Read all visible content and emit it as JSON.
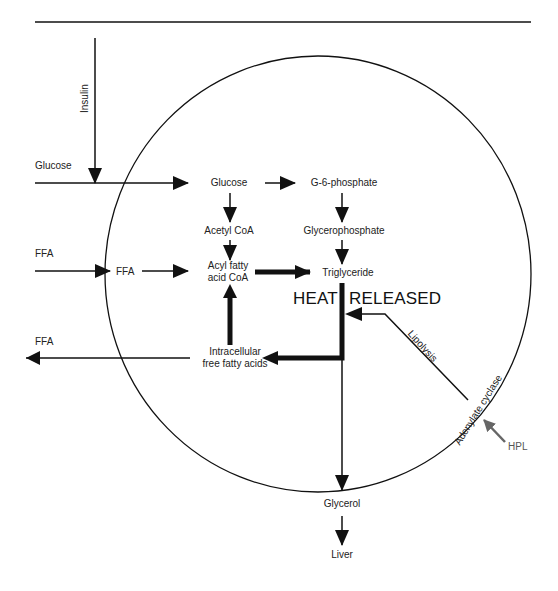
{
  "diagram": {
    "type": "metabolic-pathway",
    "cell_boundary": "circle",
    "labels": {
      "insulin": "Insulin",
      "glucose_outside": "Glucose",
      "ffa_in_outside": "FFA",
      "ffa_out_outside": "FFA",
      "ffa_inside": "FFA",
      "glucose_inside": "Glucose",
      "g6p": "G-6-phosphate",
      "acetyl_coa": "Acetyl CoA",
      "glycerophosphate": "Glycerophosphate",
      "acyl_line1": "Acyl fatty",
      "acyl_line2": "acid CoA",
      "triglyceride": "Triglyceride",
      "heat_left": "HEAT",
      "heat_right": "RELEASED",
      "intracellular_line1": "Intracellular",
      "intracellular_line2": "free fatty acids",
      "lipolysis": "Lipolysis",
      "adenylate_cyclase": "Adenylate cyclase",
      "hpl": "HPL",
      "glycerol": "Glycerol",
      "liver": "Liver"
    },
    "edges": [
      {
        "from": "Insulin",
        "to": "Glucose uptake"
      },
      {
        "from": "Glucose (outside)",
        "to": "Glucose"
      },
      {
        "from": "Glucose",
        "to": "G-6-phosphate"
      },
      {
        "from": "Glucose",
        "to": "Acetyl CoA"
      },
      {
        "from": "G-6-phosphate",
        "to": "Glycerophosphate"
      },
      {
        "from": "Acetyl CoA",
        "to": "Acyl fatty acid CoA"
      },
      {
        "from": "Glycerophosphate",
        "to": "Triglyceride"
      },
      {
        "from": "FFA (outside)",
        "to": "FFA"
      },
      {
        "from": "FFA",
        "to": "Acyl fatty acid CoA"
      },
      {
        "from": "Acyl fatty acid CoA",
        "to": "Triglyceride",
        "weight": "bold"
      },
      {
        "from": "Triglyceride",
        "to": "Intracellular free fatty acids",
        "weight": "bold"
      },
      {
        "from": "Intracellular free fatty acids",
        "to": "Acyl fatty acid CoA",
        "weight": "bold"
      },
      {
        "from": "Intracellular free fatty acids",
        "to": "FFA (outside)"
      },
      {
        "from": "Triglyceride",
        "to": "Glycerol"
      },
      {
        "from": "Glycerol",
        "to": "Liver"
      },
      {
        "from": "Adenylate cyclase",
        "to": "Triglyceride breakdown",
        "label": "Lipolysis"
      },
      {
        "from": "HPL",
        "to": "Adenylate cyclase",
        "color": "#666666"
      }
    ],
    "colors": {
      "line": "#111111",
      "hpl_arrow": "#666666",
      "background": "#ffffff"
    }
  }
}
